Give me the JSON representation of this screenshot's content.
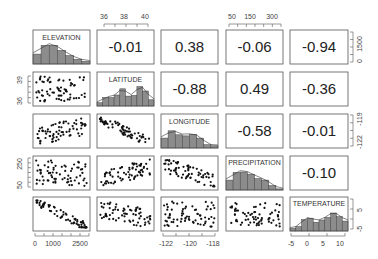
{
  "chart_data": {
    "type": "scatter-matrix",
    "title": "",
    "variables": [
      "ELEVATION",
      "LATITUDE",
      "LONGITUDE",
      "PRECIPITATION",
      "TEMPERATURE"
    ],
    "diagonal": "histogram with density line",
    "lower": "scatter",
    "upper": "correlation coefficients",
    "correlations": [
      {
        "row": 0,
        "col": 1,
        "pair": [
          "ELEVATION",
          "LATITUDE"
        ],
        "value": "-0.01"
      },
      {
        "row": 0,
        "col": 2,
        "pair": [
          "ELEVATION",
          "LONGITUDE"
        ],
        "value": "0.38"
      },
      {
        "row": 0,
        "col": 3,
        "pair": [
          "ELEVATION",
          "PRECIPITATION"
        ],
        "value": "-0.06"
      },
      {
        "row": 0,
        "col": 4,
        "pair": [
          "ELEVATION",
          "TEMPERATURE"
        ],
        "value": "-0.94"
      },
      {
        "row": 1,
        "col": 2,
        "pair": [
          "LATITUDE",
          "LONGITUDE"
        ],
        "value": "-0.88"
      },
      {
        "row": 1,
        "col": 3,
        "pair": [
          "LATITUDE",
          "PRECIPITATION"
        ],
        "value": "0.49"
      },
      {
        "row": 1,
        "col": 4,
        "pair": [
          "LATITUDE",
          "TEMPERATURE"
        ],
        "value": "-0.36"
      },
      {
        "row": 2,
        "col": 3,
        "pair": [
          "LONGITUDE",
          "PRECIPITATION"
        ],
        "value": "-0.58"
      },
      {
        "row": 2,
        "col": 4,
        "pair": [
          "LONGITUDE",
          "TEMPERATURE"
        ],
        "value": "-0.01"
      },
      {
        "row": 3,
        "col": 4,
        "pair": [
          "PRECIPITATION",
          "TEMPERATURE"
        ],
        "value": "-0.10"
      }
    ],
    "axes": {
      "top": [
        {
          "col": 1,
          "ticks": [
            "36",
            "38",
            "40"
          ]
        },
        {
          "col": 3,
          "ticks": [
            "50",
            "150",
            "300"
          ]
        }
      ],
      "bottom": [
        {
          "col": 0,
          "ticks": [
            "0",
            "1000",
            "2500"
          ]
        },
        {
          "col": 2,
          "ticks": [
            "-122",
            "-120",
            "-118"
          ]
        },
        {
          "col": 4,
          "ticks": [
            "-5",
            "0",
            "5",
            "10"
          ]
        }
      ],
      "left": [
        {
          "row": 1,
          "ticks": [
            "36",
            "39"
          ]
        },
        {
          "row": 3,
          "ticks": [
            "50",
            "250"
          ]
        }
      ],
      "right": [
        {
          "row": 0,
          "ticks": [
            "0",
            "1500"
          ]
        },
        {
          "row": 2,
          "ticks": [
            "-122",
            "-119"
          ]
        },
        {
          "row": 4,
          "ticks": [
            "-5",
            "5"
          ]
        }
      ]
    },
    "histograms": {
      "ELEVATION": [
        0.45,
        0.85,
        0.85,
        0.62,
        0.38,
        0.22,
        0.12
      ],
      "LATITUDE": [
        0.15,
        0.38,
        0.38,
        0.5,
        0.78,
        0.45,
        0.48,
        0.88,
        0.68,
        0.28
      ],
      "LONGITUDE": [
        0.45,
        0.78,
        0.6,
        0.55,
        0.62,
        0.45,
        0.15,
        0.1
      ],
      "PRECIPITATION": [
        0.45,
        0.8,
        0.82,
        0.72,
        0.52,
        0.45,
        0.2,
        0.05
      ],
      "TEMPERATURE": [
        0.12,
        0.2,
        0.52,
        0.58,
        0.4,
        0.5,
        0.62,
        0.82,
        0.65,
        0.45
      ]
    },
    "grid": false,
    "legend": null
  },
  "labels": {
    "v0": "ELEVATION",
    "v1": "LATITUDE",
    "v2": "LONGITUDE",
    "v3": "PRECIPITATION",
    "v4": "TEMPERATURE"
  },
  "corr": {
    "c01": "-0.01",
    "c02": "0.38",
    "c03": "-0.06",
    "c04": "-0.94",
    "c12": "-0.88",
    "c13": "0.49",
    "c14": "-0.36",
    "c23": "-0.58",
    "c24": "-0.01",
    "c34": "-0.10"
  },
  "ticks": {
    "top1": [
      "36",
      "38",
      "40"
    ],
    "top3": [
      "50",
      "150",
      "300"
    ],
    "bottom0": [
      "0",
      "1000",
      "2500"
    ],
    "bottom2": [
      "-122",
      "-120",
      "-118"
    ],
    "bottom4": [
      "-5",
      "0",
      "5",
      "10"
    ],
    "left1": [
      "36",
      "39"
    ],
    "left3": [
      "50",
      "250"
    ],
    "right0": [
      "0",
      "1500"
    ],
    "right2": [
      "-122",
      "-119"
    ],
    "right4": [
      "-5",
      "5"
    ]
  },
  "colors": {
    "bar_fill": "#8c8c8c",
    "bar_stroke": "#444444",
    "point": "#111111",
    "frame": "#555555"
  }
}
